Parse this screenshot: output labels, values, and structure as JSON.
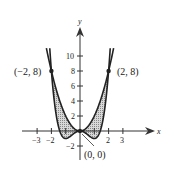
{
  "chart_data": {
    "type": "line",
    "title": "",
    "xlabel": "x",
    "ylabel": "y",
    "xlim": [
      -3.5,
      4
    ],
    "ylim": [
      -3,
      12
    ],
    "x_ticks": [
      "-3",
      "-2",
      "2",
      "3"
    ],
    "y_ticks": [
      "-2",
      "2",
      "4",
      "6",
      "8",
      "10"
    ],
    "series": [
      {
        "name": "y = 2x^2",
        "role": "upper curve"
      },
      {
        "name": "y = x^4 - 2x^2",
        "role": "lower curve"
      }
    ],
    "shaded_region": "between curves from x=-2 to x=2",
    "points": [
      {
        "label": "(-2, 8)",
        "x": -2,
        "y": 8
      },
      {
        "label": "(2, 8)",
        "x": 2,
        "y": 8
      },
      {
        "label": "(0, 0)",
        "x": 0,
        "y": 0
      }
    ]
  },
  "labels": {
    "x_axis": "x",
    "y_axis": "y",
    "pt_left": "(−2, 8)",
    "pt_right": "(2, 8)",
    "pt_origin": "(0, 0)",
    "tick_x_m3": "−3",
    "tick_x_m2": "−2",
    "tick_x_2": "2",
    "tick_x_3": "3",
    "tick_y_m2": "−2",
    "tick_y_2": "2",
    "tick_y_4": "4",
    "tick_y_6": "6",
    "tick_y_8": "8",
    "tick_y_10": "10"
  }
}
